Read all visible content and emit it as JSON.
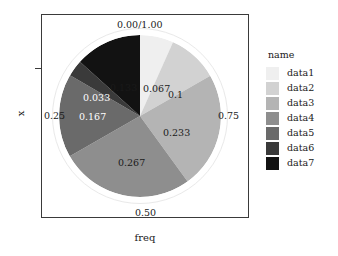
{
  "chart_data": {
    "type": "pie",
    "title": "",
    "xlabel": "freq",
    "ylabel": "x",
    "legend_title": "name",
    "legend_position": "right",
    "grid": false,
    "categories": [
      "data1",
      "data2",
      "data3",
      "data4",
      "data5",
      "data6",
      "data7"
    ],
    "values": [
      0.067,
      0.1,
      0.233,
      0.267,
      0.167,
      0.033,
      0.133
    ],
    "colors": [
      "#efefef",
      "#d2d2d2",
      "#b4b4b4",
      "#8e8e8e",
      "#6a6a6a",
      "#3a3a3a",
      "#121212"
    ],
    "slice_labels": [
      "0.067",
      "0.1",
      "0.233",
      "0.267",
      "0.167",
      "0.033",
      "0.133"
    ],
    "axis_tick_labels": [
      "0.00/1.00",
      "0.75",
      "0.50",
      "0.25"
    ],
    "start_angle_deg": 0,
    "direction": "clockwise"
  },
  "axes": {
    "y_title": "x",
    "x_title": "freq",
    "ticks": {
      "top": "0.00/1.00",
      "right": "0.75",
      "bottom": "0.50",
      "left": "0.25"
    }
  },
  "slices": [
    {
      "name": "data1",
      "value": 0.067,
      "label": "0.067",
      "color": "#efefef",
      "label_color": "dark"
    },
    {
      "name": "data2",
      "value": 0.1,
      "label": "0.1",
      "color": "#d2d2d2",
      "label_color": "dark"
    },
    {
      "name": "data3",
      "value": 0.233,
      "label": "0.233",
      "color": "#b4b4b4",
      "label_color": "dark"
    },
    {
      "name": "data4",
      "value": 0.267,
      "label": "0.267",
      "color": "#8e8e8e",
      "label_color": "dark"
    },
    {
      "name": "data5",
      "value": 0.167,
      "label": "0.167",
      "color": "#6a6a6a",
      "label_color": "white"
    },
    {
      "name": "data6",
      "value": 0.033,
      "label": "0.033",
      "color": "#3a3a3a",
      "label_color": "white"
    },
    {
      "name": "data7",
      "value": 0.133,
      "label": "0.133",
      "color": "#121212",
      "label_color": "dark"
    }
  ],
  "legend": {
    "title": "name",
    "items": [
      {
        "label": "data1",
        "color": "#efefef"
      },
      {
        "label": "data2",
        "color": "#d2d2d2"
      },
      {
        "label": "data3",
        "color": "#b4b4b4"
      },
      {
        "label": "data4",
        "color": "#8e8e8e"
      },
      {
        "label": "data5",
        "color": "#6a6a6a"
      },
      {
        "label": "data6",
        "color": "#3a3a3a"
      },
      {
        "label": "data7",
        "color": "#121212"
      }
    ]
  },
  "style": {
    "panel_border": "#3a3a3a",
    "ring_color": "#e9e9e9",
    "background": "#ffffff",
    "text_color": "#1a1a1a"
  }
}
